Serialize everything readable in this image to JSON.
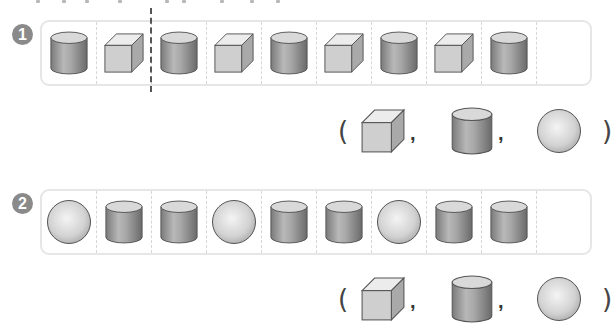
{
  "problems": [
    {
      "number": "1",
      "sequence": [
        "cylinder",
        "cube",
        "cylinder",
        "cube",
        "cylinder",
        "cube",
        "cylinder",
        "cube",
        "cylinder",
        "blank"
      ],
      "divider_after_index": 1,
      "choices": {
        "open_paren": "(",
        "close_paren": ")",
        "separator": ",",
        "options": [
          "cube",
          "cylinder",
          "sphere"
        ]
      }
    },
    {
      "number": "2",
      "sequence": [
        "sphere",
        "cylinder",
        "cylinder",
        "sphere",
        "cylinder",
        "cylinder",
        "sphere",
        "cylinder",
        "cylinder",
        "blank"
      ],
      "choices": {
        "open_paren": "(",
        "close_paren": ")",
        "separator": ",",
        "options": [
          "cube",
          "cylinder",
          "sphere"
        ]
      }
    }
  ],
  "colors": {
    "badge": "#8a8a8a",
    "box_border": "#e6e6e6",
    "cell_divider": "#d6d6d6",
    "pattern_divider": "#555555",
    "shape_stroke": "#555555"
  }
}
